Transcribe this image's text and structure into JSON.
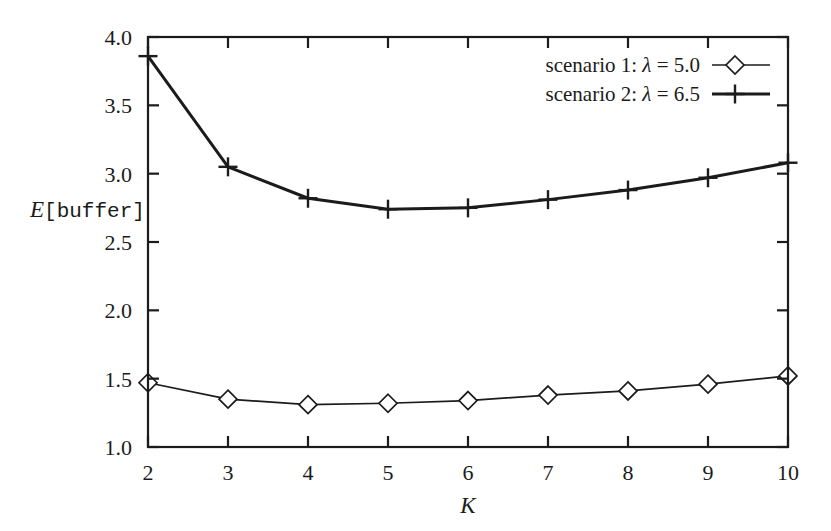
{
  "chart_data": {
    "type": "line",
    "title": "",
    "subtitle": "",
    "xlabel": "K",
    "ylabel": "E[buffer]",
    "ylabel_parts": {
      "symbol": "E",
      "bracketed": "[buffer]"
    },
    "x": [
      2,
      3,
      4,
      5,
      6,
      7,
      8,
      9,
      10
    ],
    "xlim": [
      2,
      10
    ],
    "ylim": [
      1.0,
      4.0
    ],
    "xticks": [
      "2",
      "3",
      "4",
      "5",
      "6",
      "7",
      "8",
      "9",
      "10"
    ],
    "yticks": [
      "1.0",
      "1.5",
      "2.0",
      "2.5",
      "3.0",
      "3.5",
      "4.0"
    ],
    "ytick_values": [
      1.0,
      1.5,
      2.0,
      2.5,
      3.0,
      3.5,
      4.0
    ],
    "grid": false,
    "legend_position": "top-right-inside",
    "series": [
      {
        "name": "scenario 1: λ = 5.0",
        "name_prefix": "scenario 1:",
        "lambda_symbol": "λ",
        "lambda_value": "5.0",
        "marker": "diamond",
        "values": [
          1.47,
          1.35,
          1.31,
          1.32,
          1.34,
          1.38,
          1.41,
          1.46,
          1.52
        ]
      },
      {
        "name": "scenario 2: λ = 6.5",
        "name_prefix": "scenario 2:",
        "lambda_symbol": "λ",
        "lambda_value": "6.5",
        "marker": "plus",
        "values": [
          3.86,
          3.05,
          2.82,
          2.74,
          2.75,
          2.81,
          2.88,
          2.97,
          3.08
        ]
      }
    ]
  },
  "colors": {
    "ink": "#1b1b1b",
    "background": "#ffffff"
  }
}
